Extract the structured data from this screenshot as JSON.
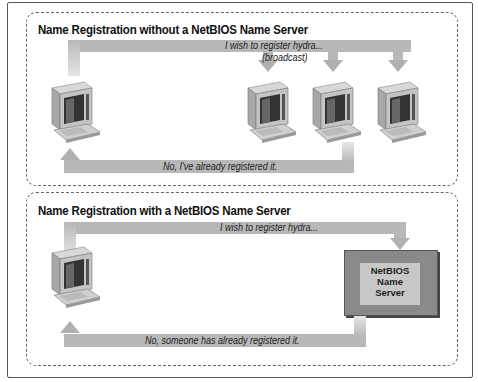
{
  "diagram": {
    "top_panel": {
      "title": "Name Registration without a NetBIOS Name Server",
      "request_label": "I wish to register hydra...",
      "request_sublabel": "(broadcast)",
      "response_label": "No, I've already registered it.",
      "nodes": [
        "client-computer",
        "host-computer-1",
        "host-computer-2",
        "host-computer-3"
      ]
    },
    "bottom_panel": {
      "title": "Name Registration with a NetBIOS Name Server",
      "request_label": "I wish to register hydra...",
      "response_label": "No, someone has already registered it.",
      "server_label_line1": "NetBIOS",
      "server_label_line2": "Name",
      "server_label_line3": "Server",
      "nodes": [
        "client-computer",
        "netbios-name-server"
      ]
    },
    "colors": {
      "arrow": "#b8b8b8",
      "server_outer": "#8a8a8a",
      "server_inner": "#c8c8c8",
      "border": "#555555"
    }
  }
}
